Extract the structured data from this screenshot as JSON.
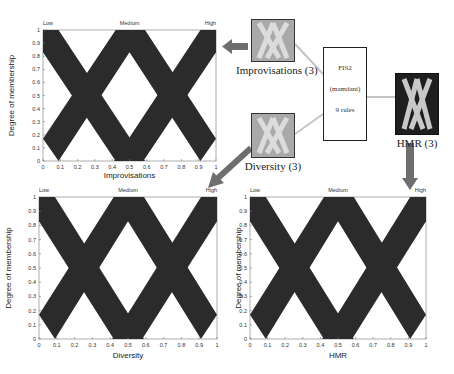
{
  "chart_data": [
    {
      "type": "area",
      "title": "",
      "xlabel": "Improvisations",
      "ylabel": "Degree of membership",
      "xlim": [
        0,
        1
      ],
      "ylim": [
        0,
        1
      ],
      "xticks": [
        "0",
        "0.1",
        "0.2",
        "0.3",
        "0.4",
        "0.5",
        "0.6",
        "0.7",
        "0.8",
        "0.9",
        "1"
      ],
      "yticks": [
        "0",
        "0.1",
        "0.2",
        "0.3",
        "0.4",
        "0.5",
        "0.6",
        "0.7",
        "0.8",
        "0.9",
        "1"
      ],
      "mf_labels": [
        "Low",
        "Medium",
        "High"
      ],
      "series": [
        {
          "name": "Low",
          "upper": [
            [
              0,
              1
            ],
            [
              0.09,
              1
            ],
            [
              0.59,
              0
            ]
          ],
          "lower": [
            [
              0,
              0.83
            ],
            [
              0.42,
              0
            ]
          ]
        },
        {
          "name": "Medium",
          "upper": [
            [
              0,
              0.17
            ],
            [
              0.42,
              1
            ],
            [
              0.59,
              1
            ],
            [
              1,
              0.17
            ]
          ],
          "lower": [
            [
              0.09,
              0
            ],
            [
              0.5,
              0.83
            ],
            [
              0.91,
              0
            ]
          ]
        },
        {
          "name": "High",
          "upper": [
            [
              0.41,
              0
            ],
            [
              0.91,
              1
            ],
            [
              1,
              1
            ]
          ],
          "lower": [
            [
              0.58,
              0
            ],
            [
              1,
              0.83
            ]
          ]
        }
      ]
    },
    {
      "type": "area",
      "title": "",
      "xlabel": "Diversity",
      "ylabel": "Degree of membership",
      "xlim": [
        0,
        1
      ],
      "ylim": [
        0,
        1
      ],
      "xticks": [
        "0",
        "0.1",
        "0.2",
        "0.3",
        "0.4",
        "0.5",
        "0.6",
        "0.7",
        "0.8",
        "0.9",
        "1"
      ],
      "yticks": [
        "0",
        "0.1",
        "0.2",
        "0.3",
        "0.4",
        "0.5",
        "0.6",
        "0.7",
        "0.8",
        "0.9",
        "1"
      ],
      "mf_labels": [
        "Low",
        "Medium",
        "High"
      ],
      "series": [
        {
          "name": "Low",
          "upper": [
            [
              0,
              1
            ],
            [
              0.09,
              1
            ],
            [
              0.59,
              0
            ]
          ],
          "lower": [
            [
              0,
              0.83
            ],
            [
              0.42,
              0
            ]
          ]
        },
        {
          "name": "Medium",
          "upper": [
            [
              0,
              0.17
            ],
            [
              0.42,
              1
            ],
            [
              0.59,
              1
            ],
            [
              1,
              0.17
            ]
          ],
          "lower": [
            [
              0.09,
              0
            ],
            [
              0.5,
              0.83
            ],
            [
              0.91,
              0
            ]
          ]
        },
        {
          "name": "High",
          "upper": [
            [
              0.41,
              0
            ],
            [
              0.91,
              1
            ],
            [
              1,
              1
            ]
          ],
          "lower": [
            [
              0.58,
              0
            ],
            [
              1,
              0.83
            ]
          ]
        }
      ]
    },
    {
      "type": "area",
      "title": "",
      "xlabel": "HMR",
      "ylabel": "Degree of membership",
      "xlim": [
        0,
        1
      ],
      "ylim": [
        0,
        1
      ],
      "xticks": [
        "0",
        "0.1",
        "0.2",
        "0.3",
        "0.4",
        "0.5",
        "0.6",
        "0.7",
        "0.8",
        "0.9",
        "1"
      ],
      "yticks": [
        "0",
        "0.1",
        "0.2",
        "0.3",
        "0.4",
        "0.5",
        "0.6",
        "0.7",
        "0.8",
        "0.9",
        "1"
      ],
      "mf_labels": [
        "Low",
        "Medium",
        "High"
      ],
      "series": [
        {
          "name": "Low",
          "upper": [
            [
              0,
              1
            ],
            [
              0.09,
              1
            ],
            [
              0.59,
              0
            ]
          ],
          "lower": [
            [
              0,
              0.83
            ],
            [
              0.42,
              0
            ]
          ]
        },
        {
          "name": "Medium",
          "upper": [
            [
              0,
              0.17
            ],
            [
              0.42,
              1
            ],
            [
              0.59,
              1
            ],
            [
              1,
              0.17
            ]
          ],
          "lower": [
            [
              0.09,
              0
            ],
            [
              0.5,
              0.83
            ],
            [
              0.91,
              0
            ]
          ]
        },
        {
          "name": "High",
          "upper": [
            [
              0.41,
              0
            ],
            [
              0.91,
              1
            ],
            [
              1,
              1
            ]
          ],
          "lower": [
            [
              0.58,
              0
            ],
            [
              1,
              0.83
            ]
          ]
        }
      ]
    }
  ],
  "diagram": {
    "inputs": [
      {
        "label": "Improvisations (3)"
      },
      {
        "label": "Diversity (3)"
      }
    ],
    "fis": {
      "name": "FIS2",
      "type": "(mamdani)",
      "rules": "9 rules"
    },
    "output": {
      "label": "HMR (3)"
    }
  },
  "colors": {
    "band": "#2b2b2b",
    "input_box": "#a9a9a9",
    "output_box": "#1e1e1e",
    "arrow": "#6e6e6e",
    "connector": "#c4c4c4"
  }
}
